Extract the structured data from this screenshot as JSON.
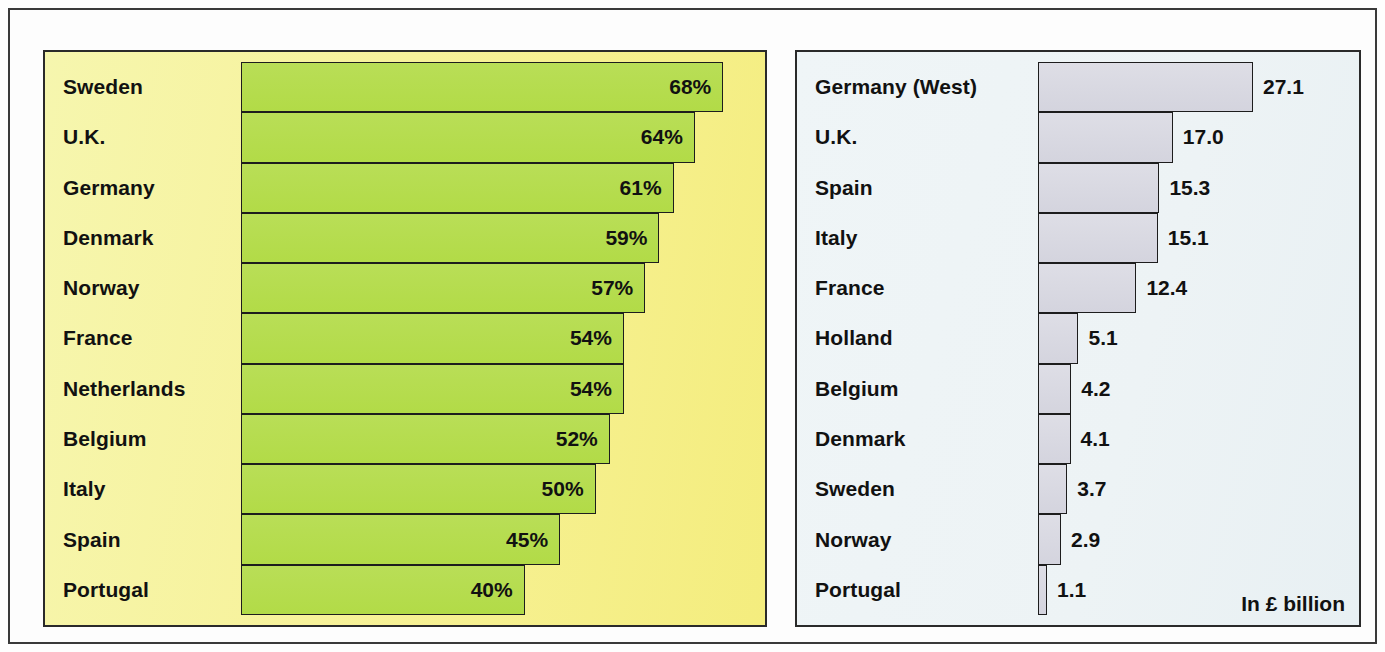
{
  "colors": {
    "left_panel_bg": "#f7f29a",
    "right_panel_bg": "#eef4f6",
    "green_bar": "#b4dc4b",
    "grey_bar": "#d9d9e2",
    "outline": "#1d1d1d",
    "text": "#111111"
  },
  "chart_data": [
    {
      "type": "bar",
      "orientation": "horizontal",
      "title": "",
      "xlabel": "",
      "ylabel": "",
      "value_suffix": "%",
      "grid": false,
      "legend": "none",
      "xlim": [
        0,
        80
      ],
      "categories": [
        "Sweden",
        "U.K.",
        "Germany",
        "Denmark",
        "Norway",
        "France",
        "Netherlands",
        "Belgium",
        "Italy",
        "Spain",
        "Portugal"
      ],
      "values": [
        68,
        64,
        61,
        59,
        57,
        54,
        54,
        52,
        50,
        45,
        40
      ],
      "value_labels": [
        "68%",
        "64%",
        "61%",
        "59%",
        "57%",
        "54%",
        "54%",
        "52%",
        "50%",
        "45%",
        "40%"
      ]
    },
    {
      "type": "bar",
      "orientation": "horizontal",
      "title": "",
      "xlabel": "",
      "ylabel": "",
      "units_note": "In £ billion",
      "grid": false,
      "legend": "none",
      "xlim": [
        0,
        30
      ],
      "categories": [
        "Germany (West)",
        "U.K.",
        "Spain",
        "Italy",
        "France",
        "Holland",
        "Belgium",
        "Denmark",
        "Sweden",
        "Norway",
        "Portugal"
      ],
      "values": [
        27.1,
        17.0,
        15.3,
        15.1,
        12.4,
        5.1,
        4.2,
        4.1,
        3.7,
        2.9,
        1.1
      ],
      "value_labels": [
        "27.1",
        "17.0",
        "15.3",
        "15.1",
        "12.4",
        "5.1",
        "4.2",
        "4.1",
        "3.7",
        "2.9",
        "1.1"
      ]
    }
  ],
  "left_chart": {
    "rows": [
      {
        "label": "Sweden",
        "value_label": "68%",
        "value": 68
      },
      {
        "label": "U.K.",
        "value_label": "64%",
        "value": 64
      },
      {
        "label": "Germany",
        "value_label": "61%",
        "value": 61
      },
      {
        "label": "Denmark",
        "value_label": "59%",
        "value": 59
      },
      {
        "label": "Norway",
        "value_label": "57%",
        "value": 57
      },
      {
        "label": "France",
        "value_label": "54%",
        "value": 54
      },
      {
        "label": "Netherlands",
        "value_label": "54%",
        "value": 54
      },
      {
        "label": "Belgium",
        "value_label": "52%",
        "value": 52
      },
      {
        "label": "Italy",
        "value_label": "50%",
        "value": 50
      },
      {
        "label": "Spain",
        "value_label": "45%",
        "value": 45
      },
      {
        "label": "Portugal",
        "value_label": "40%",
        "value": 40
      }
    ]
  },
  "right_chart": {
    "units_caption": "In £ billion",
    "rows": [
      {
        "label": "Germany (West)",
        "value_label": "27.1",
        "value": 27.1
      },
      {
        "label": "U.K.",
        "value_label": "17.0",
        "value": 17.0
      },
      {
        "label": "Spain",
        "value_label": "15.3",
        "value": 15.3
      },
      {
        "label": "Italy",
        "value_label": "15.1",
        "value": 15.1
      },
      {
        "label": "France",
        "value_label": "12.4",
        "value": 12.4
      },
      {
        "label": "Holland",
        "value_label": "5.1",
        "value": 5.1
      },
      {
        "label": "Belgium",
        "value_label": "4.2",
        "value": 4.2
      },
      {
        "label": "Denmark",
        "value_label": "4.1",
        "value": 4.1
      },
      {
        "label": "Sweden",
        "value_label": "3.7",
        "value": 3.7
      },
      {
        "label": "Norway",
        "value_label": "2.9",
        "value": 2.9
      },
      {
        "label": "Portugal",
        "value_label": "1.1",
        "value": 1.1
      }
    ]
  }
}
